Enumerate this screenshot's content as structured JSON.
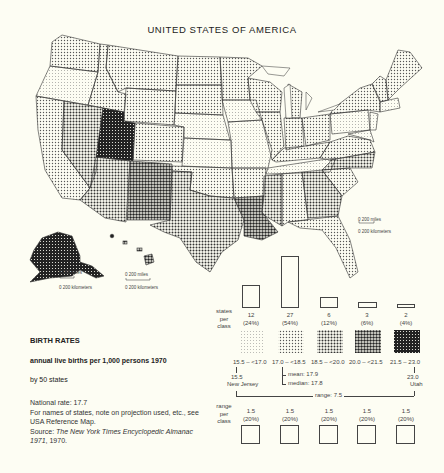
{
  "map": {
    "title": "UNITED STATES OF AMERICA",
    "scale_bars": [
      {
        "id": "alaska",
        "miles": "0   200  miles",
        "km": "0  200  kilometers"
      },
      {
        "id": "hawaii",
        "miles": "0          200  miles",
        "km": "0     200  kilometers"
      },
      {
        "id": "conus",
        "miles": "0         200  miles",
        "km": "0     200  kilometers"
      }
    ]
  },
  "legend": {
    "heading": "BIRTH RATES",
    "subheading": "annual live births per 1,000 persons 1970",
    "scope": "by 50 states",
    "national_rate": "National rate: 17.7",
    "note": "For names of states, note on projection used, etc., see USA Reference Map.",
    "source_prefix": "Source: ",
    "source_title": "The New York Times Encyclopedic Almanac 1971",
    "source_suffix": ", 1970.",
    "states_per_class_label": [
      "states",
      "per",
      "class"
    ],
    "range_per_class_label": [
      "range",
      "per",
      "class"
    ],
    "classes": [
      {
        "count": "12",
        "pct": "(24%)",
        "range": "15.5 – <17.0",
        "range_width": "1.5",
        "range_pct": "(20%)",
        "shade": "light-dots"
      },
      {
        "count": "27",
        "pct": "(54%)",
        "range": "17.0 – <18.5",
        "range_width": "1.5",
        "range_pct": "(20%)",
        "shade": "medium-dots"
      },
      {
        "count": "6",
        "pct": "(12%)",
        "range": "18.5 – <20.0",
        "range_width": "1.5",
        "range_pct": "(20%)",
        "shade": "dense-dots"
      },
      {
        "count": "3",
        "pct": "(6%)",
        "range": "20.0 – <21.5",
        "range_width": "1.5",
        "range_pct": "(20%)",
        "shade": "heavy-dots"
      },
      {
        "count": "2",
        "pct": "(4%)",
        "range": "21.5 – 23.0",
        "range_width": "1.5",
        "range_pct": "(20%)",
        "shade": "darkest"
      }
    ],
    "min": {
      "value": "15.5",
      "state": "New Jersey"
    },
    "max": {
      "value": "23.0",
      "state": "Utah"
    },
    "mean": "mean: 17.9",
    "median": "median: 17.8",
    "range": "range: 7.5"
  },
  "colors": {
    "background": "#fdfdf3",
    "ink": "#222222"
  }
}
